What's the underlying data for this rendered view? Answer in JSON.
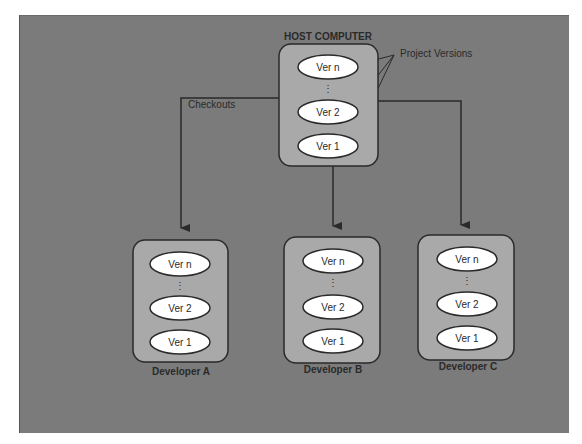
{
  "diagram": {
    "host": {
      "title": "HOST COMPUTER",
      "versions": [
        "Ver n",
        "Ver 2",
        "Ver 1"
      ],
      "ellipsis": "⋮"
    },
    "annotations": {
      "project_versions": "Project Versions",
      "checkouts": "Checkouts"
    },
    "developers": [
      {
        "name": "Developer A",
        "versions": [
          "Ver n",
          "Ver 2",
          "Ver 1"
        ]
      },
      {
        "name": "Developer B",
        "versions": [
          "Ver n",
          "Ver 2",
          "Ver 1"
        ]
      },
      {
        "name": "Developer C",
        "versions": [
          "Ver n",
          "Ver 2",
          "Ver 1"
        ]
      }
    ],
    "colors": {
      "background": "#7b7b7b",
      "box_fill": "#a9a9a9",
      "ellipse_fill": "#ffffff",
      "stroke": "#2a2a2a"
    }
  }
}
